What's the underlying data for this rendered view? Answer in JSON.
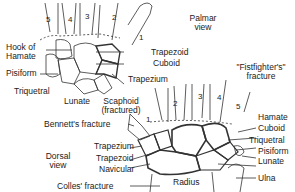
{
  "palmar": {
    "view_label_1": "Palmar",
    "view_label_2": "view",
    "digits": [
      "5",
      "4",
      "3",
      "2",
      "1"
    ],
    "labels": {
      "hook_of_hamate_1": "Hook of",
      "hook_of_hamate_2": "Hamate",
      "pisiform": "Pisiform",
      "triquetral": "Triquetral",
      "lunate": "Lunate",
      "scaphoid_1": "Scaphoid",
      "scaphoid_2": "(fractured)",
      "trapezoid": "Trapezoid",
      "cuboid": "Cuboid",
      "trapezium": "Trapezium"
    }
  },
  "dorsal": {
    "view_label_1": "Dorsal",
    "view_label_2": "view",
    "digits": [
      "1",
      "2",
      "3",
      "4",
      "5"
    ],
    "labels": {
      "fistfighters_1": "\"Fistfighter's\"",
      "fistfighters_2": "fracture",
      "bennetts": "Bennett's fracture",
      "trapezium": "Trapezium",
      "trapezoid": "Trapezoid",
      "navicular": "Navicular",
      "colles": "Colles' fracture",
      "hamate": "Hamate",
      "cuboid": "Cuboid",
      "triquetral": "Triquetral",
      "pisiform": "Pisiform",
      "lunate": "Lunate",
      "radius": "Radius",
      "ulna": "Ulna"
    }
  }
}
